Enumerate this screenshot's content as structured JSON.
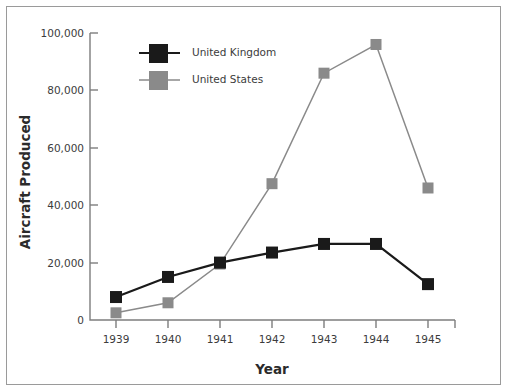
{
  "chart_data": {
    "type": "line",
    "title": "",
    "xlabel": "Year",
    "ylabel": "Aircraft Produced",
    "categories": [
      "1939",
      "1940",
      "1941",
      "1942",
      "1943",
      "1944",
      "1945"
    ],
    "x": [
      1939,
      1940,
      1941,
      1942,
      1943,
      1944,
      1945
    ],
    "series": [
      {
        "name": "United Kingdom",
        "color": "#1a1a1a",
        "marker": "square",
        "values": [
          8000,
          15000,
          20000,
          23500,
          26500,
          26500,
          12500
        ]
      },
      {
        "name": "United States",
        "color": "#8a8a8a",
        "marker": "square",
        "values": [
          2500,
          6000,
          19500,
          47500,
          86000,
          96000,
          46000
        ]
      }
    ],
    "ylim": [
      0,
      100000
    ],
    "yticks": [
      0,
      20000,
      40000,
      60000,
      80000,
      100000
    ],
    "ytick_labels": [
      "0",
      "20,000",
      "40,000",
      "60,000",
      "80,000",
      "100,000"
    ],
    "xtick_labels": [
      "1939",
      "1940",
      "1941",
      "1942",
      "1943",
      "1944",
      "1945"
    ],
    "grid": false,
    "legend_position": "upper left inside"
  },
  "axes": {
    "y_title": "Aircraft Produced",
    "x_title": "Year",
    "y_ticks": [
      "100,000",
      "80,000",
      "60,000",
      "40,000",
      "20,000",
      "0"
    ],
    "x_ticks": [
      "1939",
      "1940",
      "1941",
      "1942",
      "1943",
      "1944",
      "1945"
    ]
  },
  "legend": {
    "items": [
      {
        "label": "United Kingdom",
        "color": "#1a1a1a"
      },
      {
        "label": "United States",
        "color": "#8a8a8a"
      }
    ]
  },
  "colors": {
    "uk": "#1a1a1a",
    "us": "#8a8a8a",
    "axis": "#7d7d7d",
    "border": "#9a9a9a",
    "text": "#3c3c3c",
    "background": "#ffffff"
  }
}
